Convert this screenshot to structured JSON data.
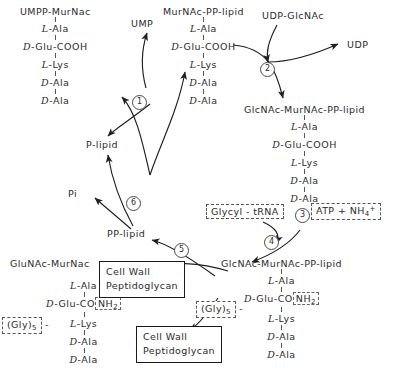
{
  "diagram": {
    "ink_color": "#2b2b2b"
  },
  "nodes": {
    "umpp_murnac": {
      "head": "UMPP-MurNac",
      "residues": [
        "L-Ala",
        "D-Glu-COOH",
        "L-Lys",
        "D-Ala",
        "D-Ala"
      ]
    },
    "murnac_pp_lipid": {
      "head": "MurNAc-PP-lipid",
      "residues": [
        "L-Ala",
        "D-Glu-COOH",
        "L-Lys",
        "D-Ala",
        "D-Ala"
      ]
    },
    "glcnac_murnac_pp_lipid_top": {
      "head": "GlcNAc-MurNAc-PP-lipid",
      "residues": [
        "L-Ala",
        "D-Glu-COOH",
        "L-Lys",
        "D-Ala",
        "D-Ala"
      ]
    },
    "glcnac_murnac_pp_lipid_bottom": {
      "head": "GlcNAc-MurNAc-PP-lipid",
      "residues": [
        "L-Ala",
        "D-Glu-CO",
        "L-Lys",
        "D-Ala",
        "D-Ala"
      ],
      "amide": "NH",
      "amide_sub": "2",
      "gly_label": "(Gly)",
      "gly_sub": "5"
    },
    "glunac_murnac": {
      "head": "GluNAc-MurNac",
      "residues": [
        "L-Ala",
        "D-Glu-CO",
        "L-Lys",
        "D-Ala",
        "D-Ala"
      ],
      "amide": "NH",
      "amide_sub": "2",
      "gly_label": "(Gly)",
      "gly_sub": "5"
    }
  },
  "small_labels": {
    "ump": "UMP",
    "udp_glcnac": "UDP-GlcNAc",
    "udp": "UDP",
    "p_lipid": "P-lipid",
    "pp_lipid": "PP-lipid",
    "pi": "Pi"
  },
  "reagents": {
    "glycyl_trna": "Glycyl - tRNA",
    "atp_nh4_prefix": "ATP + NH",
    "atp_nh4_sub": "4",
    "atp_nh4_sup": "+"
  },
  "boxes": {
    "cell_wall_line1": "Cell  Wall",
    "cell_wall_line2": "Peptidoglycan"
  },
  "steps": {
    "s1": "1",
    "s2": "2",
    "s3": "3",
    "s4": "4",
    "s5": "5",
    "s6": "6"
  }
}
